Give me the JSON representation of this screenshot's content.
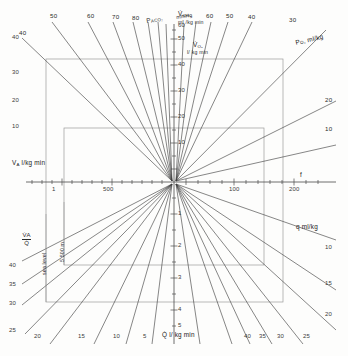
{
  "figure": {
    "type": "nomogram",
    "origin_px": [
      174,
      182
    ]
  },
  "axes": {
    "up": {
      "name": "vo2-axis",
      "label_line1": "V̇O₂",
      "label_line2": "ml / kg min",
      "ticks": [
        "10",
        "20",
        "30",
        "40",
        "50",
        "60"
      ],
      "tick_values": [
        10,
        20,
        30,
        40,
        50,
        60
      ],
      "range": [
        0,
        62
      ]
    },
    "down": {
      "name": "q-axis",
      "label": "Q̇ l/ kg min",
      "ticks": [
        "1",
        "2",
        "3",
        "4",
        "5"
      ],
      "tick_values": [
        1,
        2,
        3,
        4,
        5
      ],
      "range": [
        0,
        5.6
      ]
    },
    "right": {
      "name": "f-axis",
      "label": "f",
      "ticks": [
        "100",
        "200"
      ],
      "tick_values": [
        100,
        200
      ],
      "range": [
        0,
        260
      ]
    },
    "left": {
      "name": "tidal-volume-axis",
      "ticks": [
        "1",
        "500"
      ],
      "tick_values": [
        1,
        500
      ],
      "range": [
        0,
        1200
      ]
    }
  },
  "quadrants": {
    "top_left": {
      "name": "paco2-fan",
      "axis_label": "V̇A l/kg min",
      "family_label": "PACO₂",
      "family_units": "mmHg",
      "values": [
        "40",
        "50",
        "60",
        "70",
        "80"
      ],
      "side_ticks": [
        "10",
        "20",
        "30",
        "40"
      ]
    },
    "top_right": {
      "name": "po2-fan",
      "family_label": "PO₂",
      "family_units": "ml/kg",
      "values": [
        "10",
        "20",
        "30",
        "40",
        "50",
        "60"
      ]
    },
    "bottom_right": {
      "name": "q-content-fan",
      "family_label": "q ml/kg",
      "values": [
        "10",
        "15",
        "20",
        "25",
        "30",
        "35",
        "40"
      ]
    },
    "bottom_left": {
      "name": "va-q-ratio-fan",
      "ratio_numerator": "V̇A",
      "ratio_denominator": "Q̇",
      "values": [
        "5",
        "10",
        "15",
        "20",
        "25",
        "30",
        "35",
        "40"
      ]
    }
  },
  "annotations": {
    "sea_level": "sea level",
    "altitude": "5 500 m"
  },
  "colors": {
    "line": "#3c3c3c",
    "frame": "#8a8a8a",
    "axis": "#4a4a4a",
    "text": "#2b2b2b",
    "background": "#fdfdfc"
  }
}
